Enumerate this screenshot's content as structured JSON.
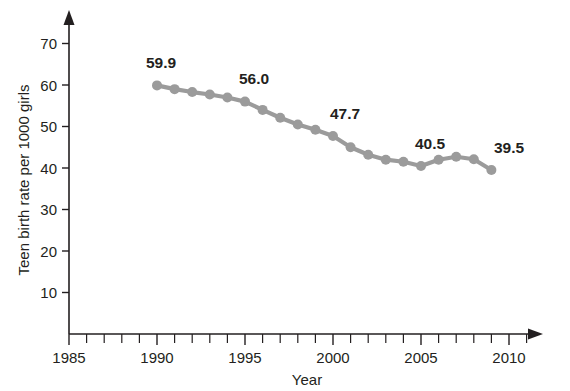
{
  "chart_data": {
    "type": "line",
    "title": "",
    "xlabel": "Year",
    "ylabel": "Teen birth rate per 1000 girls",
    "xlim": [
      1985,
      2011
    ],
    "ylim": [
      0,
      75
    ],
    "grid": false,
    "legend": false,
    "x_tick_labels": [
      "1985",
      "1990",
      "1995",
      "2000",
      "2005",
      "2010"
    ],
    "x_tick_values": [
      1985,
      1990,
      1995,
      2000,
      2005,
      2010
    ],
    "x_minor_tick_values": [
      1986,
      1987,
      1988,
      1989,
      1991,
      1992,
      1993,
      1994,
      1996,
      1997,
      1998,
      1999,
      2001,
      2002,
      2003,
      2004,
      2006,
      2007,
      2008,
      2009,
      2011
    ],
    "y_tick_labels": [
      "10",
      "20",
      "30",
      "40",
      "50",
      "60",
      "70"
    ],
    "y_tick_values": [
      10,
      20,
      30,
      40,
      50,
      60,
      70
    ],
    "x": [
      1990,
      1991,
      1992,
      1993,
      1994,
      1995,
      1996,
      1997,
      1998,
      1999,
      2000,
      2001,
      2002,
      2003,
      2004,
      2005,
      2006,
      2007,
      2008,
      2009
    ],
    "values": [
      59.9,
      59.0,
      58.3,
      57.7,
      57.0,
      56.0,
      54.0,
      52.1,
      50.5,
      49.2,
      47.7,
      45.0,
      43.2,
      42.0,
      41.5,
      40.5,
      42.0,
      42.7,
      42.1,
      39.5
    ],
    "point_labels": [
      {
        "x": 1990,
        "y": 59.9,
        "text": "59.9"
      },
      {
        "x": 1995,
        "y": 56.0,
        "text": "56.0"
      },
      {
        "x": 2000,
        "y": 47.7,
        "text": "47.7"
      },
      {
        "x": 2005,
        "y": 40.5,
        "text": "40.5"
      },
      {
        "x": 2009,
        "y": 39.5,
        "text": "39.5"
      }
    ],
    "series_color": "#9b9b9b",
    "axis_color": "#231f20"
  }
}
